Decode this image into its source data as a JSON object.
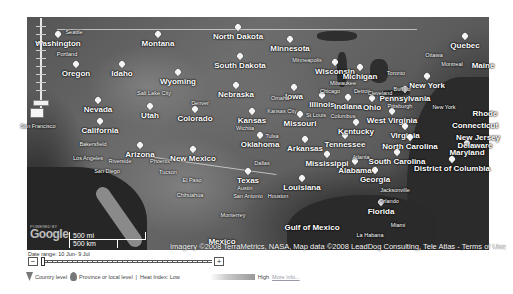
{
  "map": {
    "zoom_control": {
      "zoom_in": "+",
      "zoom_out": "−"
    },
    "labels": {
      "states": [
        {
          "text": "Washington",
          "x": 58,
          "y": 40
        },
        {
          "text": "Montana",
          "x": 158,
          "y": 40
        },
        {
          "text": "North Dakota",
          "x": 238,
          "y": 33
        },
        {
          "text": "Minnesota",
          "x": 290,
          "y": 45
        },
        {
          "text": "Oregon",
          "x": 76,
          "y": 70
        },
        {
          "text": "Idaho",
          "x": 122,
          "y": 70
        },
        {
          "text": "Wyoming",
          "x": 178,
          "y": 78
        },
        {
          "text": "South Dakota",
          "x": 240,
          "y": 62
        },
        {
          "text": "Wisconsin",
          "x": 335,
          "y": 68
        },
        {
          "text": "Michigan",
          "x": 360,
          "y": 73
        },
        {
          "text": "Iowa",
          "x": 294,
          "y": 93
        },
        {
          "text": "Nebraska",
          "x": 236,
          "y": 91
        },
        {
          "text": "Nevada",
          "x": 98,
          "y": 106
        },
        {
          "text": "Utah",
          "x": 150,
          "y": 112
        },
        {
          "text": "Colorado",
          "x": 195,
          "y": 115
        },
        {
          "text": "Kansas",
          "x": 252,
          "y": 117
        },
        {
          "text": "Missouri",
          "x": 300,
          "y": 120
        },
        {
          "text": "Illinois",
          "x": 322,
          "y": 101
        },
        {
          "text": "Indiana",
          "x": 348,
          "y": 103
        },
        {
          "text": "Ohio",
          "x": 372,
          "y": 104
        },
        {
          "text": "Pennsylvania",
          "x": 405,
          "y": 95
        },
        {
          "text": "New York",
          "x": 427,
          "y": 82
        },
        {
          "text": "California",
          "x": 100,
          "y": 127
        },
        {
          "text": "Oklahoma",
          "x": 260,
          "y": 141
        },
        {
          "text": "Arkansas",
          "x": 305,
          "y": 145
        },
        {
          "text": "Tennessee",
          "x": 345,
          "y": 141
        },
        {
          "text": "Kentucky",
          "x": 356,
          "y": 128
        },
        {
          "text": "West Virginia",
          "x": 392,
          "y": 117
        },
        {
          "text": "Virginia",
          "x": 405,
          "y": 132
        },
        {
          "text": "North Carolina",
          "x": 410,
          "y": 143
        },
        {
          "text": "South Carolina",
          "x": 397,
          "y": 158
        },
        {
          "text": "Arizona",
          "x": 140,
          "y": 151
        },
        {
          "text": "New Mexico",
          "x": 193,
          "y": 155
        },
        {
          "text": "Mississippi",
          "x": 327,
          "y": 160
        },
        {
          "text": "Alabama",
          "x": 355,
          "y": 167
        },
        {
          "text": "Georgia",
          "x": 375,
          "y": 176
        },
        {
          "text": "Texas",
          "x": 248,
          "y": 177
        },
        {
          "text": "Louisiana",
          "x": 302,
          "y": 184
        },
        {
          "text": "Florida",
          "x": 381,
          "y": 208
        },
        {
          "text": "Maryland",
          "x": 467,
          "y": 149
        },
        {
          "text": "District of Columbia",
          "x": 452,
          "y": 165
        },
        {
          "text": "Connecticut",
          "x": 475,
          "y": 122
        },
        {
          "text": "Delaware",
          "x": 475,
          "y": 142
        },
        {
          "text": "New Jersey",
          "x": 478,
          "y": 134
        },
        {
          "text": "Rhode",
          "x": 485,
          "y": 110
        },
        {
          "text": "Maine",
          "x": 483,
          "y": 62
        },
        {
          "text": "Quebec",
          "x": 465,
          "y": 42
        },
        {
          "text": "Gulf of Mexico",
          "x": 312,
          "y": 224
        },
        {
          "text": "Mexico",
          "x": 222,
          "y": 238
        }
      ],
      "cities": [
        {
          "text": "Seattle",
          "x": 74,
          "y": 29
        },
        {
          "text": "Portland",
          "x": 67,
          "y": 51
        },
        {
          "text": "Salt Lake City",
          "x": 154,
          "y": 90
        },
        {
          "text": "San Francisco",
          "x": 38,
          "y": 123
        },
        {
          "text": "Bakersfield",
          "x": 93,
          "y": 141
        },
        {
          "text": "Los Angeles",
          "x": 88,
          "y": 155
        },
        {
          "text": "Riverside",
          "x": 120,
          "y": 158
        },
        {
          "text": "San Diego",
          "x": 107,
          "y": 168
        },
        {
          "text": "Phoenix",
          "x": 160,
          "y": 158
        },
        {
          "text": "Tucson",
          "x": 168,
          "y": 169
        },
        {
          "text": "El Paso",
          "x": 192,
          "y": 177
        },
        {
          "text": "Chihuahua",
          "x": 190,
          "y": 192
        },
        {
          "text": "Denver",
          "x": 200,
          "y": 100
        },
        {
          "text": "Wichita",
          "x": 245,
          "y": 125
        },
        {
          "text": "Omaha",
          "x": 280,
          "y": 95
        },
        {
          "text": "Kansas City",
          "x": 282,
          "y": 108
        },
        {
          "text": "Tulsa",
          "x": 272,
          "y": 133
        },
        {
          "text": "Dallas",
          "x": 262,
          "y": 160
        },
        {
          "text": "Austin",
          "x": 245,
          "y": 185
        },
        {
          "text": "San Antonio",
          "x": 248,
          "y": 193
        },
        {
          "text": "Houston",
          "x": 278,
          "y": 193
        },
        {
          "text": "Monterrey",
          "x": 233,
          "y": 212
        },
        {
          "text": "Minneapolis",
          "x": 307,
          "y": 57
        },
        {
          "text": "Milwaukee",
          "x": 343,
          "y": 80
        },
        {
          "text": "Chicago",
          "x": 330,
          "y": 88
        },
        {
          "text": "Detroit",
          "x": 362,
          "y": 88
        },
        {
          "text": "St Louis",
          "x": 316,
          "y": 112
        },
        {
          "text": "Columbus",
          "x": 343,
          "y": 113
        },
        {
          "text": "Cleveland",
          "x": 380,
          "y": 90
        },
        {
          "text": "Buffalo",
          "x": 402,
          "y": 86
        },
        {
          "text": "Toronto",
          "x": 396,
          "y": 70
        },
        {
          "text": "Ottawa",
          "x": 434,
          "y": 52
        },
        {
          "text": "Montreal",
          "x": 452,
          "y": 61
        },
        {
          "text": "Pittsburgh",
          "x": 400,
          "y": 103
        },
        {
          "text": "New York",
          "x": 444,
          "y": 104
        },
        {
          "text": "Atlanta",
          "x": 361,
          "y": 154
        },
        {
          "text": "Jacksonville",
          "x": 395,
          "y": 187
        },
        {
          "text": "Orlando",
          "x": 389,
          "y": 198
        },
        {
          "text": "Miami",
          "x": 398,
          "y": 222
        },
        {
          "text": "La Habana",
          "x": 370,
          "y": 232
        }
      ]
    },
    "scale": {
      "miles": "500 mi",
      "km": "500 km"
    },
    "logo": {
      "powered_by": "POWERED BY",
      "name": "Google"
    },
    "attribution": {
      "text": "Imagery ©2008 TerraMetrics, NASA, Map data ©2008 LeadDog Consulting, Tele Atlas - ",
      "terms": "Terms of Use"
    }
  },
  "timeline": {
    "date_range": "Date range: 10 Jun- 9 Jul",
    "zoom_out": "−",
    "zoom_in": "+"
  },
  "legend": {
    "country_level": "Country level",
    "province_level": "Province or local level",
    "separator": "|",
    "heat_index_low": "Heat Index: Low",
    "heat_index_high": "High",
    "more_info": "More info..."
  }
}
